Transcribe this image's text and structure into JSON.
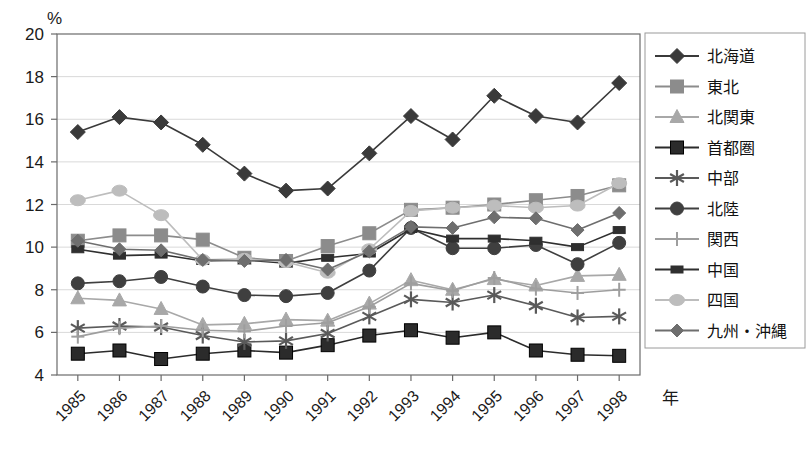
{
  "chart_data": {
    "type": "line",
    "title": "",
    "xlabel": "年",
    "ylabel": "%",
    "ylim": [
      4,
      20
    ],
    "ytick_step": 2,
    "yticks": [
      4,
      6,
      8,
      10,
      12,
      14,
      16,
      18,
      20
    ],
    "grid": true,
    "legend_position": "right",
    "categories": [
      1985,
      1986,
      1987,
      1988,
      1989,
      1990,
      1991,
      1992,
      1993,
      1994,
      1995,
      1996,
      1997,
      1998
    ],
    "xtick_labels": [
      "1985",
      "1986",
      "1987",
      "1988",
      "1989",
      "1990",
      "1991",
      "1992",
      "1993",
      "1994",
      "1995",
      "1996",
      "1997",
      "1998"
    ],
    "series": [
      {
        "name": "北海道",
        "marker": "diamond",
        "color": "#3a3a3a",
        "line_color": "#3a3a3a",
        "values": [
          15.4,
          16.1,
          15.85,
          14.8,
          13.45,
          12.65,
          12.75,
          14.4,
          16.15,
          15.05,
          17.1,
          16.15,
          15.85,
          17.7
        ]
      },
      {
        "name": "東北",
        "marker": "square",
        "color": "#8c8c8c",
        "line_color": "#8c8c8c",
        "values": [
          10.3,
          10.55,
          10.55,
          10.35,
          9.5,
          9.35,
          10.05,
          10.65,
          11.75,
          11.85,
          12.0,
          12.2,
          12.4,
          12.9
        ]
      },
      {
        "name": "北関東",
        "marker": "triangle",
        "color": "#a8a8a8",
        "line_color": "#a8a8a8",
        "values": [
          7.6,
          7.5,
          7.1,
          6.35,
          6.4,
          6.6,
          6.55,
          7.35,
          8.45,
          8.0,
          8.5,
          8.2,
          8.65,
          8.7
        ]
      },
      {
        "name": "首都圏",
        "marker": "square-filled",
        "color": "#2b2b2b",
        "line_color": "#2b2b2b",
        "values": [
          5.0,
          5.15,
          4.75,
          5.0,
          5.15,
          5.05,
          5.4,
          5.85,
          6.1,
          5.75,
          6.0,
          5.15,
          4.95,
          4.9
        ]
      },
      {
        "name": "中部",
        "marker": "asterisk",
        "color": "#5a5a5a",
        "line_color": "#5a5a5a",
        "values": [
          6.2,
          6.3,
          6.25,
          5.85,
          5.55,
          5.6,
          5.95,
          6.75,
          7.55,
          7.4,
          7.75,
          7.25,
          6.7,
          6.75
        ]
      },
      {
        "name": "北陸",
        "marker": "circle",
        "color": "#3f3f3f",
        "line_color": "#3f3f3f",
        "values": [
          8.3,
          8.4,
          8.6,
          8.15,
          7.75,
          7.7,
          7.85,
          8.9,
          10.9,
          9.95,
          9.95,
          10.1,
          9.2,
          10.2
        ]
      },
      {
        "name": "関西",
        "marker": "plus",
        "color": "#9e9e9e",
        "line_color": "#9e9e9e",
        "values": [
          5.8,
          6.2,
          6.3,
          6.1,
          6.05,
          6.3,
          6.45,
          7.2,
          8.3,
          7.95,
          8.55,
          8.05,
          7.85,
          8.0
        ]
      },
      {
        "name": "中国",
        "marker": "small-rect",
        "color": "#2f2f2f",
        "line_color": "#2f2f2f",
        "values": [
          9.9,
          9.6,
          9.65,
          9.35,
          9.4,
          9.25,
          9.5,
          9.7,
          10.85,
          10.4,
          10.4,
          10.3,
          10.0,
          10.8
        ]
      },
      {
        "name": "四国",
        "marker": "blob",
        "color": "#bdbdbd",
        "line_color": "#bdbdbd",
        "values": [
          12.2,
          12.65,
          11.5,
          9.4,
          9.45,
          9.3,
          8.8,
          9.9,
          11.7,
          11.85,
          11.95,
          11.85,
          11.95,
          13.0
        ]
      },
      {
        "name": "九州・沖縄",
        "marker": "diamond-mid",
        "color": "#6e6e6e",
        "line_color": "#6e6e6e",
        "values": [
          10.3,
          9.9,
          9.85,
          9.4,
          9.35,
          9.4,
          8.95,
          9.8,
          10.95,
          10.9,
          11.4,
          11.35,
          10.8,
          11.6
        ]
      }
    ]
  },
  "legend": {
    "entries": [
      {
        "label": "北海道"
      },
      {
        "label": "東北"
      },
      {
        "label": "北関東"
      },
      {
        "label": "首都圏"
      },
      {
        "label": "中部"
      },
      {
        "label": "北陸"
      },
      {
        "label": "関西"
      },
      {
        "label": "中国"
      },
      {
        "label": "四国"
      },
      {
        "label": "九州・沖縄"
      }
    ]
  }
}
